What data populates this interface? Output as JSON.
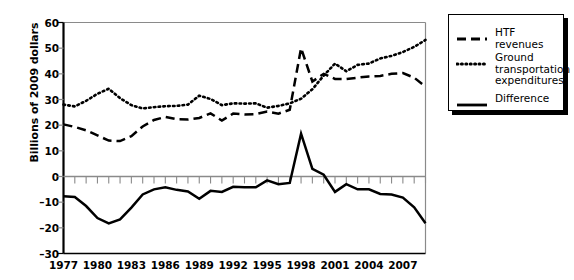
{
  "chart_data": {
    "type": "line",
    "title": "",
    "subtitle": "",
    "xlabel": "",
    "ylabel": "Billions of 2009 dollars",
    "ylim": [
      -30,
      60
    ],
    "xlim": [
      1977,
      2009
    ],
    "grid": false,
    "legend_position": "right-outside",
    "ytick_labels": [
      "60",
      "50",
      "40",
      "30",
      "20",
      "10",
      "0",
      "–10",
      "–20",
      "–30"
    ],
    "ytick_values": [
      60,
      50,
      40,
      30,
      20,
      10,
      0,
      -10,
      -20,
      -30
    ],
    "xtick_labels": [
      "1977",
      "1980",
      "1983",
      "1986",
      "1989",
      "1992",
      "1995",
      "1998",
      "2001",
      "2004",
      "2007"
    ],
    "xtick_values": [
      1977,
      1980,
      1983,
      1986,
      1989,
      1992,
      1995,
      1998,
      2001,
      2004,
      2007
    ],
    "x": [
      1977,
      1978,
      1979,
      1980,
      1981,
      1982,
      1983,
      1984,
      1985,
      1986,
      1987,
      1988,
      1989,
      1990,
      1991,
      1992,
      1993,
      1994,
      1995,
      1996,
      1997,
      1998,
      1999,
      2000,
      2001,
      2002,
      2003,
      2004,
      2005,
      2006,
      2007,
      2008,
      2009
    ],
    "series": [
      {
        "name": "HTF revenues",
        "style": "dashed",
        "color": "#000000",
        "values": [
          20.3,
          19.3,
          18.0,
          16.0,
          14.0,
          13.8,
          15.7,
          19.5,
          22.0,
          23.2,
          22.3,
          22.2,
          22.8,
          24.6,
          21.8,
          24.5,
          24.2,
          24.3,
          25.3,
          24.5,
          26.0,
          50.0,
          37.0,
          40.0,
          38.0,
          38.0,
          38.5,
          39.0,
          39.2,
          40.0,
          40.3,
          38.5,
          35.0
        ]
      },
      {
        "name": "Ground transportation expenditures",
        "style": "dotted",
        "color": "#000000",
        "values": [
          28.0,
          27.3,
          29.5,
          32.2,
          34.2,
          30.5,
          27.8,
          26.5,
          27.0,
          27.4,
          27.5,
          28.0,
          31.5,
          30.2,
          27.8,
          28.5,
          28.4,
          28.5,
          26.8,
          27.5,
          28.5,
          30.3,
          34.0,
          39.3,
          44.0,
          41.0,
          43.5,
          44.0,
          46.0,
          47.0,
          48.5,
          50.5,
          53.2
        ]
      },
      {
        "name": "Difference",
        "style": "solid",
        "color": "#000000",
        "values": [
          -7.7,
          -8.0,
          -11.5,
          -16.2,
          -18.3,
          -16.7,
          -12.1,
          -7.0,
          -5.0,
          -4.2,
          -5.2,
          -5.8,
          -8.7,
          -5.6,
          -6.0,
          -4.0,
          -4.2,
          -4.2,
          -1.5,
          -3.0,
          -2.5,
          16.7,
          3.0,
          0.7,
          -6.0,
          -3.0,
          -5.0,
          -5.0,
          -6.8,
          -7.0,
          -8.2,
          -12.0,
          -18.2
        ]
      }
    ]
  },
  "legend": {
    "entries": [
      {
        "label": "HTF revenues",
        "style": "dashed"
      },
      {
        "label": "Ground transportation expenditures",
        "style": "dotted"
      },
      {
        "label": "Difference",
        "style": "solid"
      }
    ]
  }
}
